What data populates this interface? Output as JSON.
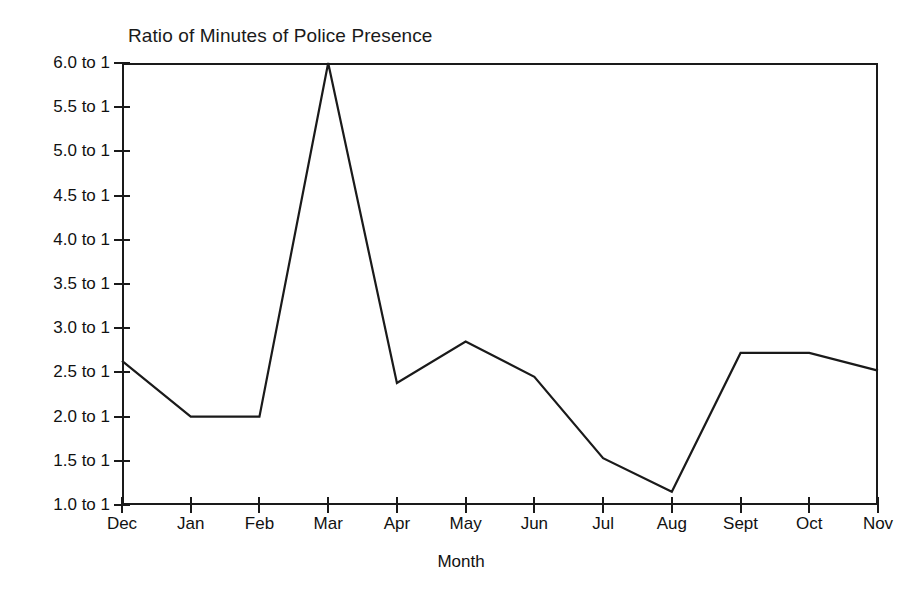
{
  "chart_data": {
    "type": "line",
    "title": "Ratio of Minutes of Police Presence",
    "xlabel": "Month",
    "ylabel": "",
    "categories": [
      "Dec",
      "Jan",
      "Feb",
      "Mar",
      "Apr",
      "May",
      "Jun",
      "Jul",
      "Aug",
      "Sept",
      "Oct",
      "Nov"
    ],
    "values": [
      2.63,
      2.0,
      2.0,
      6.0,
      2.38,
      2.85,
      2.45,
      1.53,
      1.15,
      2.72,
      2.72,
      2.52
    ],
    "ylim": [
      1.0,
      6.0
    ],
    "ytick_values": [
      6.0,
      5.5,
      5.0,
      4.5,
      4.0,
      3.5,
      3.0,
      2.5,
      2.0,
      1.5,
      1.0
    ],
    "ytick_labels": [
      "6.0 to 1",
      "5.5 to 1",
      "5.0 to 1",
      "4.5 to 1",
      "4.0 to 1",
      "3.5 to 1",
      "3.0 to 1",
      "2.5 to 1",
      "2.0 to 1",
      "1.5 to 1",
      "1.0 to 1"
    ],
    "grid": false,
    "legend": false,
    "line_color": "#1a1a1a"
  }
}
